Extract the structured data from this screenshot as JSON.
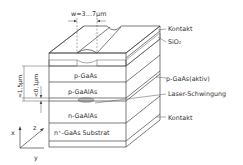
{
  "diagram": {
    "width_annotation": "w≈3…7µm",
    "thickness_annotation_outer": "≈1,5µm",
    "thickness_annotation_inner": "<0,1µm",
    "front_layers": [
      {
        "id": "sio2-hatch",
        "label": ""
      },
      {
        "id": "p-gaas",
        "label": "p-GaAs"
      },
      {
        "id": "p-gaalas",
        "label": "p-GaAlAs"
      },
      {
        "id": "active",
        "label": ""
      },
      {
        "id": "n-gaalas",
        "label": "n-GaAlAs"
      },
      {
        "id": "substrate",
        "label": "n⁺-GaAs Substrat"
      },
      {
        "id": "bottom-contact",
        "label": ""
      }
    ],
    "callouts": [
      {
        "id": "top-contact",
        "label": "Kontakt"
      },
      {
        "id": "sio2",
        "label": "SiO₂"
      },
      {
        "id": "active-layer",
        "label": "p-GaAs(aktiv)"
      },
      {
        "id": "laser",
        "label": "Laser-Schwingung"
      },
      {
        "id": "bottom-contact",
        "label": "Kontakt"
      }
    ],
    "axes": {
      "x": "x",
      "y": "y",
      "z": "z"
    },
    "colors": {
      "line": "#444444",
      "background": "#ffffff",
      "hatch": "#666666"
    }
  }
}
